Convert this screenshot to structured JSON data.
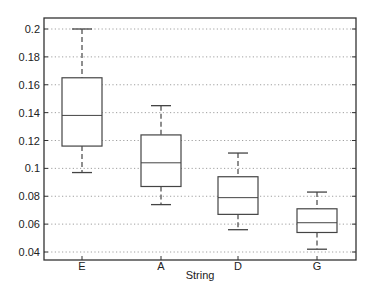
{
  "chart_data": {
    "type": "boxplot",
    "title": "",
    "xlabel": "String",
    "ylabel": "",
    "categories": [
      "E",
      "A",
      "D",
      "G"
    ],
    "ylim": [
      0.033,
      0.213
    ],
    "yticks": [
      0.04,
      0.06,
      0.08,
      0.1,
      0.12,
      0.14,
      0.16,
      0.18,
      0.2
    ],
    "ytick_labels": [
      "0.04",
      "0.06",
      "0.08",
      "0.1",
      "0.12",
      "0.14",
      "0.16",
      "0.18",
      "0.2"
    ],
    "grid": "horizontal-dotted",
    "legend": "none",
    "boxes": [
      {
        "label": "E",
        "whisker_low": 0.097,
        "q1": 0.116,
        "median": 0.138,
        "q3": 0.165,
        "whisker_high": 0.2
      },
      {
        "label": "A",
        "whisker_low": 0.074,
        "q1": 0.087,
        "median": 0.104,
        "q3": 0.124,
        "whisker_high": 0.145
      },
      {
        "label": "D",
        "whisker_low": 0.056,
        "q1": 0.067,
        "median": 0.079,
        "q3": 0.094,
        "whisker_high": 0.111
      },
      {
        "label": "G",
        "whisker_low": 0.042,
        "q1": 0.054,
        "median": 0.061,
        "q3": 0.071,
        "whisker_high": 0.083
      }
    ]
  },
  "colors": {
    "frame": "#333333",
    "box": "#444444",
    "grid": "#888888",
    "text": "#222222"
  }
}
